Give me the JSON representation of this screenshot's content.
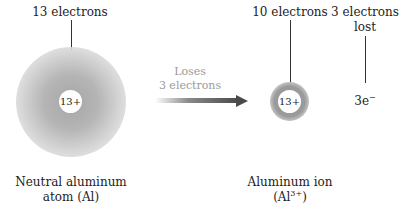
{
  "neutral_atom": {
    "electron_label": "13 electrons",
    "nucleus_charge": "13+",
    "caption_line1": "Neutral aluminum",
    "caption_line2": "atom (Al)"
  },
  "transition": {
    "line1": "Loses",
    "line2": "3 electrons"
  },
  "ion": {
    "electron_label": "10 electrons",
    "nucleus_charge": "13+",
    "caption_line1": "Aluminum ion",
    "caption_prefix": "(Al",
    "caption_superscript": "3+",
    "caption_suffix": ")"
  },
  "lost": {
    "label_line1": "3 electrons",
    "label_line2": "lost",
    "symbol": "3e",
    "symbol_superscript": "−"
  }
}
